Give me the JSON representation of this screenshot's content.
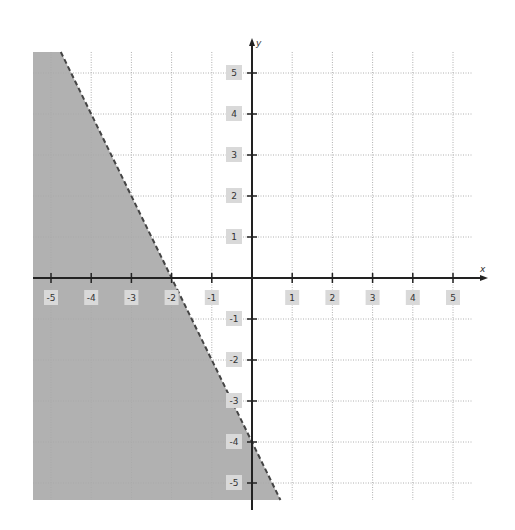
{
  "chart_data": {
    "type": "line",
    "title": "",
    "subtitle": "",
    "xlabel": "x",
    "ylabel": "y",
    "xlim": [
      -5.5,
      5.5
    ],
    "ylim": [
      -5.5,
      5.5
    ],
    "grid": true,
    "legend": null,
    "x_ticks": [
      -5,
      -4,
      -3,
      -2,
      -1,
      1,
      2,
      3,
      4,
      5
    ],
    "y_ticks": [
      5,
      4,
      3,
      2,
      1,
      -1,
      -2,
      -3,
      -4,
      -5
    ],
    "x_tick_labels": [
      "-5",
      "-4",
      "-3",
      "-2",
      "-1",
      "1",
      "2",
      "3",
      "4",
      "5"
    ],
    "y_tick_labels": [
      "5",
      "4",
      "3",
      "2",
      "1",
      "-1",
      "-2",
      "-3",
      "-4",
      "-5"
    ],
    "series": [
      {
        "name": "boundary line",
        "style": "dashed",
        "equation": "y = -2x - 4",
        "points": [
          [
            -4.75,
            5.5
          ],
          [
            -2,
            0
          ],
          [
            0,
            -4
          ],
          [
            0.75,
            -5.5
          ]
        ]
      }
    ],
    "shaded_region": {
      "inequality": "y < -2x - 4",
      "side": "left/below boundary",
      "color": "#a8a8a8"
    },
    "annotations": []
  },
  "colors": {
    "background": "#ffffff",
    "grid": "#b0b0b0",
    "axis": "#222222",
    "shade": "#a8a8a8",
    "label_box": "#d9d9d9",
    "boundary": "#444444"
  }
}
